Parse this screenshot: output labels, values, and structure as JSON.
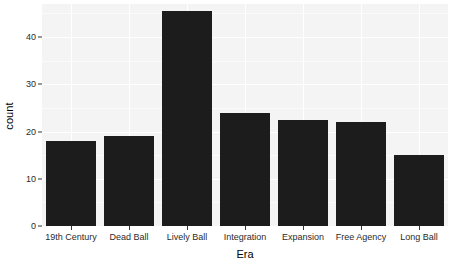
{
  "chart_data": {
    "type": "bar",
    "title": "",
    "xlabel": "Era",
    "ylabel": "count",
    "categories": [
      "19th Century",
      "Dead Ball",
      "Lively Ball",
      "Integration",
      "Expansion",
      "Free Agency",
      "Long Ball"
    ],
    "values": [
      18,
      19,
      45.5,
      24,
      22.5,
      22,
      15
    ],
    "ylim": [
      0,
      47
    ],
    "y_ticks": [
      0,
      10,
      20,
      30,
      40
    ],
    "y_tick_labels": [
      "0",
      "10",
      "20",
      "30",
      "40"
    ],
    "y_minor_ticks": [
      5,
      15,
      25,
      35,
      45
    ],
    "grid": true,
    "legend": "none",
    "bar_color": "#1c1c1c",
    "panel_color": "#f4f4f4",
    "grid_color": "#ffffff"
  },
  "axes": {
    "y_title": "count",
    "x_title": "Era"
  }
}
